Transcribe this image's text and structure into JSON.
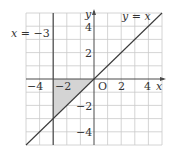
{
  "figure": {
    "type": "coordinate-plane",
    "x_range": [
      -5,
      5
    ],
    "y_range": [
      -5,
      5
    ],
    "grid_step": 1,
    "origin_label": "O",
    "x_axis_label": "x",
    "y_axis_label": "y",
    "x_ticks": [
      {
        "value": -4,
        "label": "−4"
      },
      {
        "value": -2,
        "label": "−2"
      },
      {
        "value": 2,
        "label": "2"
      },
      {
        "value": 4,
        "label": "4"
      }
    ],
    "y_ticks": [
      {
        "value": 4,
        "label": "4"
      },
      {
        "value": 2,
        "label": "2"
      },
      {
        "value": -2,
        "label": "−2"
      },
      {
        "value": -4,
        "label": "−4"
      }
    ],
    "lines": [
      {
        "equation": "x = −3",
        "label": "x = −3",
        "kind": "vertical",
        "x": -3
      },
      {
        "equation": "y = x",
        "label": "y = x",
        "kind": "diagonal",
        "slope": 1,
        "intercept": 0
      }
    ],
    "shaded_region": {
      "vertices": [
        [
          -3,
          0
        ],
        [
          0,
          0
        ],
        [
          -3,
          -3
        ]
      ],
      "color": "#d4d4d4"
    },
    "colors": {
      "grid": "#c9c9c9",
      "axis": "#4a4a4a",
      "line": "#3a3a3a",
      "text": "#333333"
    }
  },
  "labels": {
    "line1": "x = −3",
    "line1_x": "x",
    "line1_eq": " = −3",
    "line2_y": "y",
    "line2_eq": " = ",
    "line2_x": "x",
    "origin": "O",
    "x_axis": "x",
    "y_axis": "y",
    "xt_m4": "−4",
    "xt_m2": "−2",
    "xt_2": "2",
    "xt_4": "4",
    "yt_4": "4",
    "yt_2": "2",
    "yt_m2": "−2",
    "yt_m4": "−4"
  }
}
